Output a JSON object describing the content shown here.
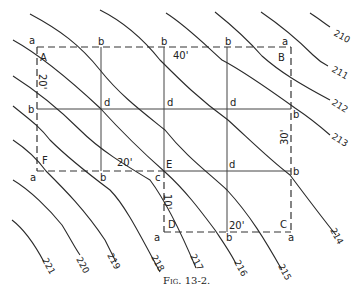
{
  "figure": {
    "caption": "Fig. 13-2.",
    "corners": {
      "A": "A",
      "B": "B",
      "C": "C",
      "D": "D",
      "E": "E",
      "F": "F"
    },
    "dimensions": {
      "top": "40'",
      "left": "20'",
      "right": "30'",
      "middle": "20'",
      "inner_vertical": "10'",
      "bottom": "20'"
    },
    "point_labels": {
      "a": "a",
      "b": "b",
      "c": "c",
      "d": "d"
    },
    "contour_labels": [
      "210",
      "211",
      "212",
      "213",
      "214",
      "215",
      "216",
      "217",
      "218",
      "219",
      "220",
      "221"
    ]
  }
}
